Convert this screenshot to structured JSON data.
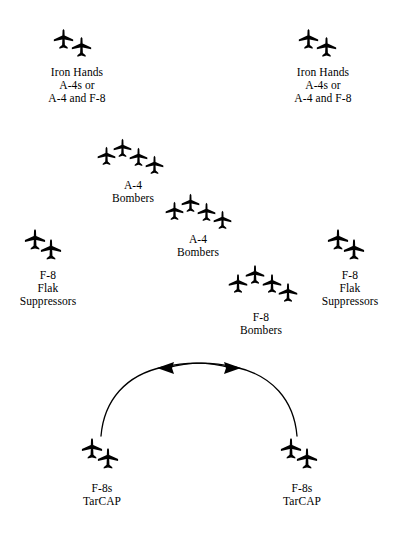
{
  "diagram": {
    "background_color": "#ffffff",
    "ink_color": "#000000",
    "width": 398,
    "height": 535,
    "groups": [
      {
        "id": "iron-hands-left",
        "label_lines": [
          "Iron Hands",
          "A-4s or",
          "A-4 and F-8"
        ],
        "aircraft_count": 2,
        "aircraft_type": "jet-silhouette-top-view",
        "position": {
          "x": 52,
          "y": 28
        },
        "label_position": {
          "x": 22,
          "y": 66
        }
      },
      {
        "id": "iron-hands-right",
        "label_lines": [
          "Iron Hands",
          "A-4s or",
          "A-4 and F-8"
        ],
        "aircraft_count": 2,
        "aircraft_type": "jet-silhouette-top-view",
        "position": {
          "x": 297,
          "y": 28
        },
        "label_position": {
          "x": 268,
          "y": 66
        }
      },
      {
        "id": "a4-bombers-upper",
        "label_lines": [
          "A-4",
          "Bombers"
        ],
        "aircraft_count": 4,
        "aircraft_type": "jet-silhouette-top-view",
        "position": {
          "x": 96,
          "y": 140
        },
        "label_position": {
          "x": 98,
          "y": 178
        }
      },
      {
        "id": "a4-bombers-lower",
        "label_lines": [
          "A-4",
          "Bombers"
        ],
        "aircraft_count": 4,
        "aircraft_type": "jet-silhouette-top-view",
        "position": {
          "x": 164,
          "y": 194
        },
        "label_position": {
          "x": 163,
          "y": 232
        }
      },
      {
        "id": "f8-flak-suppressors-left",
        "label_lines": [
          "F-8",
          "Flak",
          "Suppressors"
        ],
        "aircraft_count": 2,
        "aircraft_type": "jet-silhouette-top-view",
        "position": {
          "x": 23,
          "y": 228
        },
        "label_position": {
          "x": 6,
          "y": 268
        }
      },
      {
        "id": "f8-flak-suppressors-right",
        "label_lines": [
          "F-8",
          "Flak",
          "Suppressors"
        ],
        "aircraft_count": 2,
        "aircraft_type": "jet-silhouette-top-view",
        "position": {
          "x": 326,
          "y": 228
        },
        "label_position": {
          "x": 310,
          "y": 268
        }
      },
      {
        "id": "f8-bombers",
        "label_lines": [
          "F-8",
          "Bombers"
        ],
        "aircraft_count": 4,
        "aircraft_type": "jet-silhouette-top-view",
        "position": {
          "x": 227,
          "y": 265
        },
        "label_position": {
          "x": 226,
          "y": 310
        }
      },
      {
        "id": "f8s-tarcap-left",
        "label_lines": [
          "F-8s",
          "TarCAP"
        ],
        "aircraft_count": 2,
        "aircraft_type": "jet-silhouette-top-view",
        "position": {
          "x": 80,
          "y": 437
        },
        "label_position": {
          "x": 62,
          "y": 481
        }
      },
      {
        "id": "f8s-tarcap-right",
        "label_lines": [
          "F-8s",
          "TarCAP"
        ],
        "aircraft_count": 2,
        "aircraft_type": "jet-silhouette-top-view",
        "position": {
          "x": 279,
          "y": 437
        },
        "label_position": {
          "x": 262,
          "y": 481
        }
      }
    ],
    "arcs": [
      {
        "id": "tarcap-arc-left-to-right",
        "description": "curved patrol path sweeping from lower-left up and across to upper-right arrowhead",
        "path": "M 100 437 C 112 372 172 352 232 369",
        "arrowhead": "right"
      },
      {
        "id": "tarcap-arc-right-to-left",
        "description": "curved patrol path sweeping from lower-right up and across to upper-left arrowhead",
        "path": "M 298 437 C 286 372 226 352 166 369",
        "arrowhead": "left"
      }
    ]
  }
}
